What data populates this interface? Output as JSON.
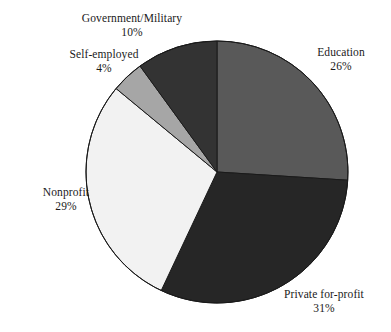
{
  "chart_data": {
    "type": "pie",
    "title": "",
    "subtitle": "",
    "xlabel": "",
    "ylabel": "",
    "legend_position": "none",
    "grid": false,
    "labels_outside": true,
    "start_angle_deg": 0,
    "direction": "clockwise",
    "categories": [
      "Education",
      "Private for-profit",
      "Nonprofit",
      "Self-employed",
      "Government/Military"
    ],
    "values": [
      26,
      31,
      29,
      4,
      10
    ],
    "units": "percent",
    "slices": [
      {
        "name": "education",
        "label": "Education",
        "value": 26,
        "value_text": "26%",
        "color": "#595959",
        "start_deg": 0,
        "end_deg": 93.6
      },
      {
        "name": "private-for-profit",
        "label": "Private for-profit",
        "value": 31,
        "value_text": "31%",
        "color": "#262626",
        "start_deg": 93.6,
        "end_deg": 205.2
      },
      {
        "name": "nonprofit",
        "label": "Nonprofit",
        "value": 29,
        "value_text": "29%",
        "color": "#f2f2f2",
        "start_deg": 205.2,
        "end_deg": 309.6
      },
      {
        "name": "self-employed",
        "label": "Self-employed",
        "value": 4,
        "value_text": "4%",
        "color": "#a6a6a6",
        "start_deg": 309.6,
        "end_deg": 324.0
      },
      {
        "name": "government-military",
        "label": "Government/Military",
        "value": 10,
        "value_text": "10%",
        "color": "#333333",
        "start_deg": 324.0,
        "end_deg": 360.0
      }
    ],
    "geometry": {
      "center_x": 217,
      "center_y": 172,
      "radius": 131
    },
    "style": {
      "background": "#ffffff",
      "outline_color": "#1a1a1a",
      "outline_width": 1,
      "text_color": "#1a1a1a"
    }
  }
}
